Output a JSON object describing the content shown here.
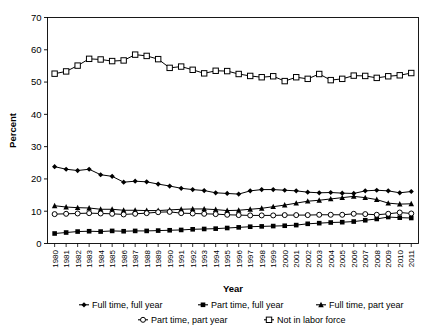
{
  "chart_data": {
    "type": "line",
    "title": "",
    "xlabel": "Year",
    "ylabel": "Percent",
    "ylim": [
      0,
      70
    ],
    "yticks": [
      0,
      10,
      20,
      30,
      40,
      50,
      60,
      70
    ],
    "grid": false,
    "legend_position": "bottom",
    "categories": [
      "1980",
      "1981",
      "1982",
      "1983",
      "1984",
      "1985",
      "1986",
      "1987",
      "1988",
      "1989",
      "1990",
      "1991",
      "1992",
      "1993",
      "1994",
      "1995",
      "1996",
      "1997",
      "1998",
      "1999",
      "2000",
      "2001",
      "2002",
      "2003",
      "2004",
      "2005",
      "2006",
      "2007",
      "2008",
      "2009",
      "2010",
      "2011"
    ],
    "series": [
      {
        "name": "Full time, full year",
        "marker": "filled-diamond",
        "values": [
          23.8,
          23.0,
          22.6,
          23.0,
          21.3,
          20.8,
          19.0,
          19.3,
          19.1,
          18.4,
          17.8,
          17.1,
          16.7,
          16.4,
          15.7,
          15.5,
          15.3,
          16.3,
          16.7,
          16.7,
          16.5,
          16.3,
          15.9,
          15.7,
          15.8,
          15.6,
          15.5,
          16.3,
          16.5,
          16.3,
          15.7,
          16.1
        ]
      },
      {
        "name": "Part time, full year",
        "marker": "filled-square",
        "values": [
          3.1,
          3.4,
          3.7,
          3.8,
          3.7,
          3.9,
          3.8,
          3.9,
          3.9,
          4.0,
          4.1,
          4.2,
          4.4,
          4.5,
          4.6,
          4.8,
          5.0,
          5.2,
          5.3,
          5.4,
          5.5,
          5.7,
          6.1,
          6.3,
          6.5,
          6.6,
          6.8,
          7.2,
          7.6,
          8.2,
          8.0,
          7.9
        ]
      },
      {
        "name": "Full time, part year",
        "marker": "filled-triangle",
        "values": [
          11.7,
          11.3,
          11.1,
          11.0,
          10.6,
          10.6,
          10.3,
          10.3,
          10.2,
          10.2,
          10.4,
          10.6,
          10.7,
          10.7,
          10.5,
          10.2,
          10.3,
          10.6,
          10.9,
          11.4,
          11.9,
          12.5,
          13.1,
          13.4,
          13.8,
          14.2,
          14.6,
          14.2,
          13.6,
          12.5,
          12.2,
          12.3
        ]
      },
      {
        "name": "Part time, part year",
        "marker": "open-circle",
        "values": [
          9.1,
          9.2,
          9.3,
          9.4,
          9.3,
          9.2,
          9.0,
          9.2,
          9.4,
          9.7,
          9.8,
          9.4,
          9.3,
          9.2,
          9.1,
          8.9,
          8.8,
          8.7,
          8.7,
          8.7,
          8.8,
          8.8,
          8.8,
          8.9,
          8.9,
          8.9,
          9.2,
          9.1,
          8.9,
          9.2,
          9.6,
          9.3
        ]
      },
      {
        "name": "Not in labor force",
        "marker": "open-square",
        "values": [
          52.6,
          53.3,
          55.1,
          57.2,
          57.0,
          56.5,
          56.7,
          58.5,
          58.1,
          57.1,
          54.4,
          54.8,
          53.8,
          52.7,
          53.5,
          53.4,
          52.5,
          51.9,
          51.5,
          51.8,
          50.3,
          51.5,
          51.0,
          52.5,
          50.6,
          51.0,
          52.0,
          51.9,
          51.3,
          51.8,
          52.1,
          52.8
        ]
      }
    ]
  },
  "legend": {
    "items": [
      {
        "label": "Full time, full year",
        "marker": "filled-diamond"
      },
      {
        "label": "Part time, full year",
        "marker": "filled-square"
      },
      {
        "label": "Full time, part year",
        "marker": "filled-triangle"
      },
      {
        "label": "Part time, part year",
        "marker": "open-circle"
      },
      {
        "label": "Not in labor force",
        "marker": "open-square"
      }
    ]
  },
  "colors": {
    "line": "#000000",
    "axis": "#000000",
    "background": "#ffffff"
  }
}
